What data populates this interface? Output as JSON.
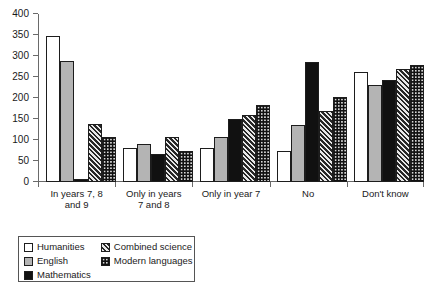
{
  "chart_data": {
    "type": "bar",
    "title": "",
    "subtitle": "",
    "xlabel": "",
    "ylabel": "",
    "ylim": [
      0,
      400
    ],
    "ytick_step": 50,
    "yticks": [
      0,
      50,
      100,
      150,
      200,
      250,
      300,
      350,
      400
    ],
    "ytick_labels": [
      "0",
      "50",
      "100",
      "150",
      "200",
      "250",
      "300",
      "350",
      "400"
    ],
    "grid": false,
    "legend_position": "below-left",
    "categories": [
      "In years 7, 8\nand 9",
      "Only in years\n7 and 8",
      "Only in year 7",
      "No",
      "Don't know"
    ],
    "series": [
      {
        "name": "Humanities",
        "pattern": "solid-white",
        "color": "#ffffff",
        "values": [
          347,
          81,
          81,
          75,
          261
        ]
      },
      {
        "name": "English",
        "pattern": "solid-gray",
        "color": "#b4b4b4",
        "values": [
          288,
          91,
          106,
          136,
          230
        ]
      },
      {
        "name": "Mathematics",
        "pattern": "solid-black",
        "color": "#111111",
        "values": [
          8,
          67,
          150,
          285,
          244
        ]
      },
      {
        "name": "Combined science",
        "pattern": "diagonal-hatch",
        "color": "#272727",
        "values": [
          138,
          108,
          160,
          168,
          270
        ]
      },
      {
        "name": "Modern languages",
        "pattern": "dotted-black",
        "color": "#111111",
        "values": [
          106,
          73,
          183,
          203,
          279
        ]
      }
    ]
  },
  "legend": {
    "items": [
      {
        "label": "Humanities",
        "swatch": "swatch-humanities"
      },
      {
        "label": "English",
        "swatch": "swatch-english"
      },
      {
        "label": "Mathematics",
        "swatch": "swatch-mathematics"
      },
      {
        "label": "Combined science",
        "swatch": "swatch-combined-science"
      },
      {
        "label": "Modern languages",
        "swatch": "swatch-modern-languages"
      }
    ]
  },
  "colors": {
    "axis": "#6a6a6a",
    "text": "#1a1a1a",
    "bar_border": "#1d1d1d",
    "background": "#ffffff"
  }
}
